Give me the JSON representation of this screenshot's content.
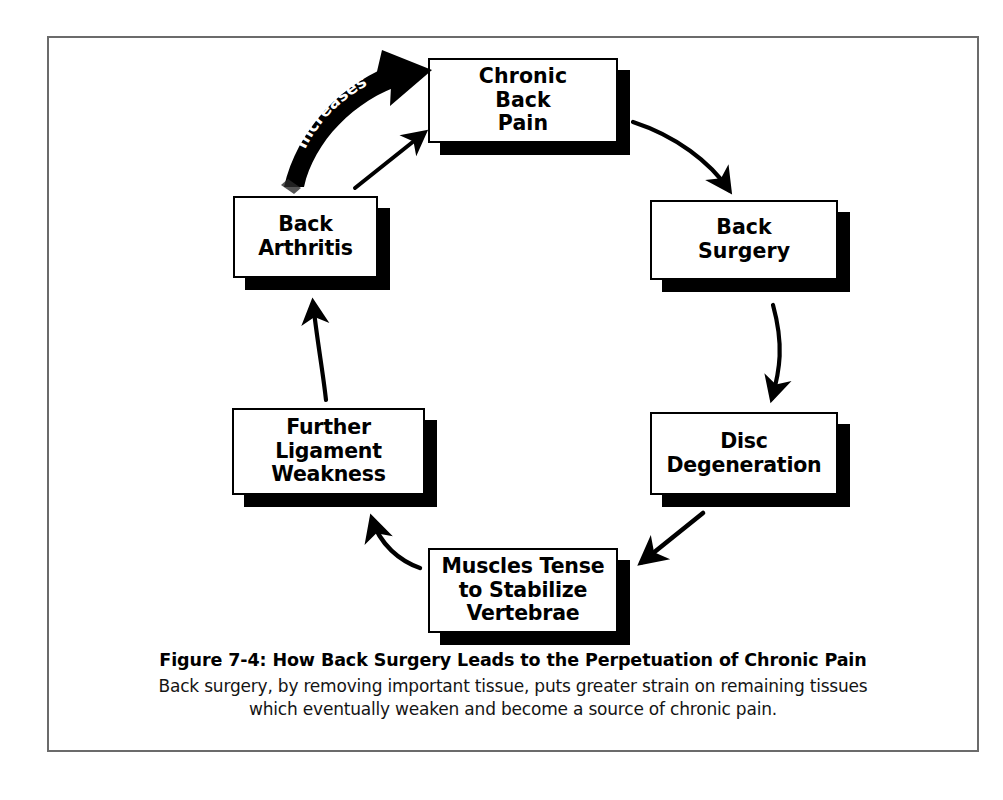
{
  "figure": {
    "frame_color": "#6b6b6b",
    "background": "#ffffff",
    "ink_color": "#000000"
  },
  "diagram": {
    "type": "cycle-flowchart",
    "direction": "clockwise",
    "nodes": [
      {
        "id": "chronic-back-pain",
        "label": "Chronic\nBack\nPain"
      },
      {
        "id": "back-surgery",
        "label": "Back\nSurgery"
      },
      {
        "id": "disc-degeneration",
        "label": "Disc\nDegeneration"
      },
      {
        "id": "muscles-tense",
        "label": "Muscles Tense\nto Stabilize\nVertebrae"
      },
      {
        "id": "further-ligament-weakness",
        "label": "Further\nLigament\nWeakness"
      },
      {
        "id": "back-arthritis",
        "label": "Back\nArthritis"
      }
    ],
    "edges": [
      {
        "from": "chronic-back-pain",
        "to": "back-surgery",
        "style": "curved",
        "label": ""
      },
      {
        "from": "back-surgery",
        "to": "disc-degeneration",
        "style": "curved",
        "label": ""
      },
      {
        "from": "disc-degeneration",
        "to": "muscles-tense",
        "style": "straight",
        "label": ""
      },
      {
        "from": "muscles-tense",
        "to": "further-ligament-weakness",
        "style": "curved",
        "label": ""
      },
      {
        "from": "further-ligament-weakness",
        "to": "back-arthritis",
        "style": "curved",
        "label": ""
      },
      {
        "from": "back-arthritis",
        "to": "chronic-back-pain",
        "style": "straight",
        "label": ""
      },
      {
        "from": "back-arthritis",
        "to": "chronic-back-pain",
        "style": "ribbon",
        "label": "Increases"
      }
    ],
    "ribbon_label": "Increases",
    "ribbon_label_chars": [
      "I",
      "n",
      "c",
      "r",
      "e",
      "a",
      "s",
      "e",
      "s"
    ]
  },
  "caption": {
    "title": "Figure 7-4: How Back Surgery Leads to the Perpetuation of Chronic Pain",
    "body": "Back surgery, by removing important tissue, puts greater strain on remaining tissues\nwhich eventually weaken and become a source of chronic pain."
  }
}
